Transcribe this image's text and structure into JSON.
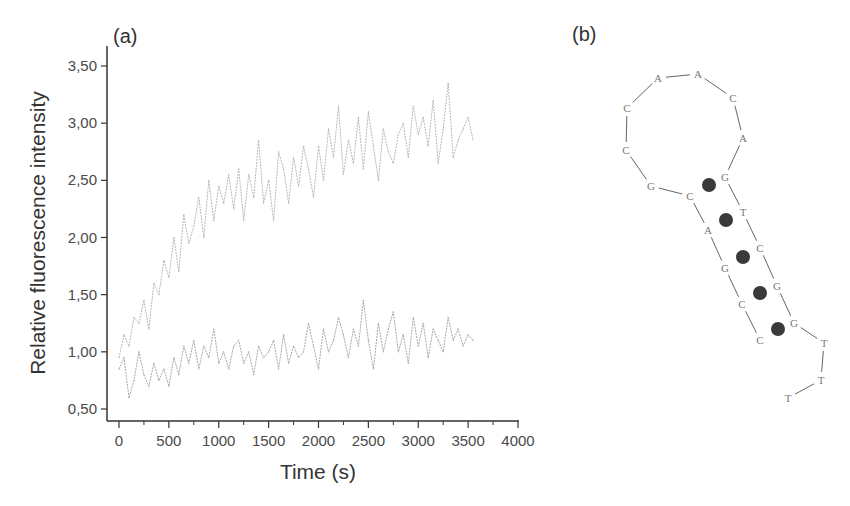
{
  "panels": {
    "a_label": "(a)",
    "b_label": "(b)"
  },
  "chart_data": {
    "type": "line",
    "title": "",
    "xlabel": "Time (s)",
    "ylabel": "Relative fluorescence intensity",
    "xlim": [
      0,
      4000
    ],
    "ylim": [
      0.5,
      3.5
    ],
    "xticks": [
      0,
      500,
      1000,
      1500,
      2000,
      2500,
      3000,
      3500,
      4000
    ],
    "xtick_labels": [
      "0",
      "500",
      "1000",
      "1500",
      "2000",
      "2500",
      "3000",
      "3500",
      "4000"
    ],
    "yticks": [
      0.5,
      1.0,
      1.5,
      2.0,
      2.5,
      3.0,
      3.5
    ],
    "ytick_labels": [
      "0,50",
      "1,00",
      "1,50",
      "2,00",
      "2,50",
      "3,00",
      "3,50"
    ],
    "grid": false,
    "legend": "none",
    "x": [
      0,
      50,
      100,
      150,
      200,
      250,
      300,
      350,
      400,
      450,
      500,
      550,
      600,
      650,
      700,
      750,
      800,
      850,
      900,
      950,
      1000,
      1050,
      1100,
      1150,
      1200,
      1250,
      1300,
      1350,
      1400,
      1450,
      1500,
      1550,
      1600,
      1650,
      1700,
      1750,
      1800,
      1850,
      1900,
      1950,
      2000,
      2050,
      2100,
      2150,
      2200,
      2250,
      2300,
      2350,
      2400,
      2450,
      2500,
      2550,
      2600,
      2650,
      2700,
      2750,
      2800,
      2850,
      2900,
      2950,
      3000,
      3050,
      3100,
      3150,
      3200,
      3250,
      3300,
      3350,
      3400,
      3450,
      3500,
      3550
    ],
    "series": [
      {
        "name": "top-trace",
        "color": "#b8b8b8",
        "values": [
          0.95,
          1.15,
          1.05,
          1.3,
          1.25,
          1.45,
          1.2,
          1.6,
          1.5,
          1.8,
          1.65,
          2.0,
          1.7,
          2.2,
          1.95,
          2.1,
          2.35,
          2.0,
          2.5,
          2.15,
          2.45,
          2.3,
          2.55,
          2.25,
          2.6,
          2.15,
          2.55,
          2.35,
          2.85,
          2.3,
          2.5,
          2.15,
          2.75,
          2.6,
          2.3,
          2.7,
          2.45,
          2.8,
          2.6,
          2.35,
          2.8,
          2.5,
          2.95,
          2.7,
          3.15,
          2.55,
          2.85,
          2.65,
          3.05,
          2.6,
          3.1,
          2.8,
          2.5,
          2.95,
          2.75,
          2.65,
          2.9,
          3.0,
          2.7,
          3.15,
          2.9,
          3.05,
          2.8,
          3.2,
          2.65,
          2.95,
          3.35,
          2.7,
          2.85,
          2.95,
          3.05,
          2.85
        ]
      },
      {
        "name": "bottom-trace",
        "color": "#a8a8a8",
        "values": [
          0.85,
          0.95,
          0.6,
          0.75,
          1.0,
          0.8,
          0.7,
          0.9,
          0.75,
          0.85,
          0.7,
          0.95,
          0.8,
          1.05,
          0.9,
          1.1,
          0.85,
          1.05,
          0.95,
          1.2,
          0.9,
          1.0,
          0.85,
          1.05,
          1.1,
          0.9,
          1.0,
          0.8,
          1.05,
          0.95,
          1.0,
          1.1,
          0.85,
          1.15,
          0.9,
          1.05,
          0.95,
          1.0,
          1.25,
          1.05,
          0.85,
          1.2,
          1.0,
          1.1,
          1.3,
          1.15,
          0.95,
          1.2,
          1.05,
          1.45,
          1.1,
          0.85,
          1.25,
          1.0,
          1.2,
          1.35,
          1.0,
          1.15,
          0.9,
          1.3,
          1.05,
          1.25,
          0.95,
          1.2,
          1.1,
          1.0,
          1.3,
          1.1,
          1.2,
          1.05,
          1.15,
          1.1
        ]
      }
    ]
  },
  "hairpin": {
    "nucleotides": [
      {
        "base": "G",
        "role": "stem-left-top"
      },
      {
        "base": "G",
        "role": "loop"
      },
      {
        "base": "C",
        "role": "loop"
      },
      {
        "base": "C",
        "role": "loop"
      },
      {
        "base": "A",
        "role": "loop"
      },
      {
        "base": "A",
        "role": "loop"
      },
      {
        "base": "C",
        "role": "loop"
      },
      {
        "base": "A",
        "role": "loop"
      },
      {
        "base": "G",
        "role": "stem-right"
      },
      {
        "base": "T",
        "role": "stem-right"
      },
      {
        "base": "C",
        "role": "stem-right"
      },
      {
        "base": "G",
        "role": "stem-right"
      },
      {
        "base": "G",
        "role": "stem-right"
      },
      {
        "base": "T",
        "role": "tail"
      },
      {
        "base": "T",
        "role": "tail"
      },
      {
        "base": "T",
        "role": "tail"
      }
    ],
    "stem_left": [
      "C",
      "A",
      "G",
      "C",
      "C"
    ],
    "base_pairs": 5,
    "pair_marker_color": "#3a3a3a"
  }
}
